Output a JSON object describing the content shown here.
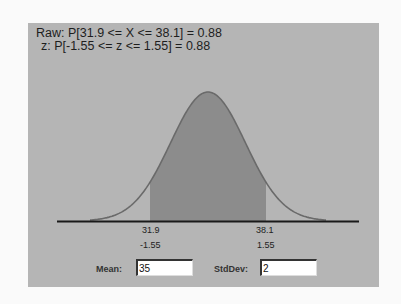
{
  "header": {
    "raw_line": "Raw: P[31.9 <= X <= 38.1] = 0.88",
    "z_line": " z: P[-1.55 <= z <= 1.55] = 0.88"
  },
  "axis": {
    "lower_raw": "31.9",
    "lower_z": "-1.55",
    "upper_raw": "38.1",
    "upper_z": "1.55"
  },
  "controls": {
    "mean_label": "Mean:",
    "mean_value": "35",
    "stddev_label": "StdDev:",
    "stddev_value": "2"
  },
  "colors": {
    "panel_bg": "#b5b5b5",
    "shade_fill": "#8c8c8c",
    "curve_stroke": "#6a6a6a",
    "baseline": "#1a1a1a"
  },
  "chart_data": {
    "type": "area",
    "distribution": "normal",
    "mean": 35,
    "stddev": 2,
    "shaded_interval_raw": [
      31.9,
      38.1
    ],
    "shaded_interval_z": [
      -1.55,
      1.55
    ],
    "probability": 0.88,
    "tick_labels": [
      "31.9",
      "-1.55",
      "38.1",
      "1.55"
    ],
    "xlabel": "",
    "ylabel": "",
    "grid": false
  }
}
